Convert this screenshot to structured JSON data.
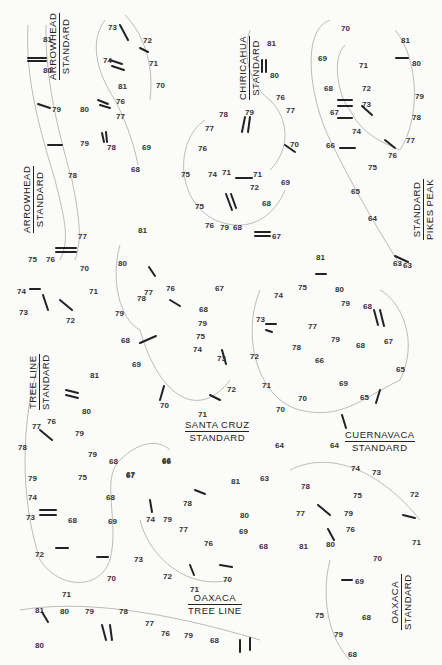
{
  "figure": {
    "panels": [
      {
        "id": "arrowhead-standard-1",
        "line1": "ARROWHEAD",
        "line2": "STANDARD",
        "x": 48,
        "y": 80,
        "vertical": true
      },
      {
        "id": "chiricahua-standard",
        "line1": "CHIRICAHUA",
        "line2": "STANDARD",
        "x": 238,
        "y": 100,
        "vertical": true
      },
      {
        "id": "standard-pikes-peak",
        "line1": "STANDARD",
        "line2": "PIKES PEAK",
        "x": 412,
        "y": 240,
        "vertical": true
      },
      {
        "id": "arrowhead-standard-2",
        "line1": "ARROWHEAD",
        "line2": "STANDARD",
        "x": 22,
        "y": 233,
        "vertical": true
      },
      {
        "id": "tree-line-standard",
        "line1": "TREE LINE",
        "line2": "STANDARD",
        "x": 28,
        "y": 410,
        "vertical": true
      },
      {
        "id": "santa-cruz-standard",
        "line1": "SANTA CRUZ",
        "line2": "STANDARD",
        "x": 185,
        "y": 420,
        "vertical": false
      },
      {
        "id": "cuernavaca-standard",
        "line1": "CUERNAVACA",
        "line2": "STANDARD",
        "x": 345,
        "y": 430,
        "vertical": false
      },
      {
        "id": "oaxaca-tree-line",
        "line1": "OAXACA",
        "line2": "TREE LINE",
        "x": 188,
        "y": 593,
        "vertical": false
      },
      {
        "id": "oaxaca-standard",
        "line1": "OAXACA",
        "line2": "STANDARD",
        "x": 390,
        "y": 630,
        "vertical": true
      }
    ],
    "band_labels": [
      {
        "t": "81",
        "x": 43,
        "y": 36
      },
      {
        "t": "80",
        "x": 43,
        "y": 67
      },
      {
        "t": "79",
        "x": 52,
        "y": 106
      },
      {
        "t": "78",
        "x": 68,
        "y": 172
      },
      {
        "t": "77",
        "x": 78,
        "y": 233
      },
      {
        "t": "73",
        "x": 108,
        "y": 24
      },
      {
        "t": "72",
        "x": 143,
        "y": 37
      },
      {
        "t": "74",
        "x": 103,
        "y": 57
      },
      {
        "t": "71",
        "x": 149,
        "y": 60
      },
      {
        "t": "70",
        "x": 156,
        "y": 82
      },
      {
        "t": "81",
        "x": 118,
        "y": 83
      },
      {
        "t": "80",
        "x": 80,
        "y": 106
      },
      {
        "t": "76",
        "x": 116,
        "y": 98
      },
      {
        "t": "77",
        "x": 116,
        "y": 113
      },
      {
        "t": "79",
        "x": 80,
        "y": 140
      },
      {
        "t": "78",
        "x": 107,
        "y": 144
      },
      {
        "t": "69",
        "x": 142,
        "y": 144
      },
      {
        "t": "68",
        "x": 131,
        "y": 166
      },
      {
        "t": "81",
        "x": 267,
        "y": 40
      },
      {
        "t": "80",
        "x": 270,
        "y": 72
      },
      {
        "t": "76",
        "x": 276,
        "y": 94
      },
      {
        "t": "77",
        "x": 286,
        "y": 107
      },
      {
        "t": "78",
        "x": 219,
        "y": 111
      },
      {
        "t": "79",
        "x": 245,
        "y": 109
      },
      {
        "t": "70",
        "x": 290,
        "y": 141
      },
      {
        "t": "77",
        "x": 205,
        "y": 125
      },
      {
        "t": "76",
        "x": 198,
        "y": 145
      },
      {
        "t": "75",
        "x": 181,
        "y": 171
      },
      {
        "t": "74",
        "x": 208,
        "y": 171
      },
      {
        "t": "71",
        "x": 222,
        "y": 169
      },
      {
        "t": "71",
        "x": 253,
        "y": 171
      },
      {
        "t": "72",
        "x": 250,
        "y": 184
      },
      {
        "t": "69",
        "x": 281,
        "y": 179
      },
      {
        "t": "75",
        "x": 195,
        "y": 203
      },
      {
        "t": "68",
        "x": 262,
        "y": 200
      },
      {
        "t": "76",
        "x": 205,
        "y": 222
      },
      {
        "t": "79",
        "x": 220,
        "y": 224
      },
      {
        "t": "68",
        "x": 233,
        "y": 224
      },
      {
        "t": "67",
        "x": 272,
        "y": 233
      },
      {
        "t": "70",
        "x": 341,
        "y": 25
      },
      {
        "t": "69",
        "x": 318,
        "y": 55
      },
      {
        "t": "71",
        "x": 359,
        "y": 62
      },
      {
        "t": "68",
        "x": 324,
        "y": 85
      },
      {
        "t": "72",
        "x": 362,
        "y": 85
      },
      {
        "t": "67",
        "x": 330,
        "y": 109
      },
      {
        "t": "73",
        "x": 362,
        "y": 101
      },
      {
        "t": "74",
        "x": 352,
        "y": 128
      },
      {
        "t": "66",
        "x": 326,
        "y": 142
      },
      {
        "t": "75",
        "x": 368,
        "y": 164
      },
      {
        "t": "81",
        "x": 401,
        "y": 37
      },
      {
        "t": "80",
        "x": 412,
        "y": 60
      },
      {
        "t": "79",
        "x": 415,
        "y": 93
      },
      {
        "t": "78",
        "x": 412,
        "y": 114
      },
      {
        "t": "77",
        "x": 406,
        "y": 137
      },
      {
        "t": "76",
        "x": 388,
        "y": 152
      },
      {
        "t": "65",
        "x": 351,
        "y": 188
      },
      {
        "t": "64",
        "x": 368,
        "y": 215
      },
      {
        "t": "63",
        "x": 393,
        "y": 260
      },
      {
        "t": "76",
        "x": 46,
        "y": 256
      },
      {
        "t": "75",
        "x": 28,
        "y": 256
      },
      {
        "t": "70",
        "x": 80,
        "y": 265
      },
      {
        "t": "74",
        "x": 17,
        "y": 288
      },
      {
        "t": "71",
        "x": 89,
        "y": 288
      },
      {
        "t": "73",
        "x": 19,
        "y": 309
      },
      {
        "t": "72",
        "x": 66,
        "y": 317
      },
      {
        "t": "81",
        "x": 138,
        "y": 227
      },
      {
        "t": "80",
        "x": 118,
        "y": 260
      },
      {
        "t": "77",
        "x": 144,
        "y": 289
      },
      {
        "t": "76",
        "x": 166,
        "y": 285
      },
      {
        "t": "78",
        "x": 137,
        "y": 295
      },
      {
        "t": "67",
        "x": 215,
        "y": 285
      },
      {
        "t": "79",
        "x": 115,
        "y": 310
      },
      {
        "t": "68",
        "x": 199,
        "y": 306
      },
      {
        "t": "79",
        "x": 198,
        "y": 320
      },
      {
        "t": "68",
        "x": 121,
        "y": 337
      },
      {
        "t": "75",
        "x": 196,
        "y": 333
      },
      {
        "t": "74",
        "x": 193,
        "y": 346
      },
      {
        "t": "69",
        "x": 132,
        "y": 361
      },
      {
        "t": "73",
        "x": 217,
        "y": 355
      },
      {
        "t": "72",
        "x": 227,
        "y": 386
      },
      {
        "t": "70",
        "x": 160,
        "y": 402
      },
      {
        "t": "71",
        "x": 198,
        "y": 411
      },
      {
        "t": "81",
        "x": 316,
        "y": 254
      },
      {
        "t": "75",
        "x": 298,
        "y": 284
      },
      {
        "t": "80",
        "x": 335,
        "y": 286
      },
      {
        "t": "74",
        "x": 274,
        "y": 292
      },
      {
        "t": "79",
        "x": 341,
        "y": 300
      },
      {
        "t": "68",
        "x": 363,
        "y": 303
      },
      {
        "t": "73",
        "x": 256,
        "y": 316
      },
      {
        "t": "77",
        "x": 308,
        "y": 323
      },
      {
        "t": "79",
        "x": 331,
        "y": 336
      },
      {
        "t": "78",
        "x": 292,
        "y": 344
      },
      {
        "t": "68",
        "x": 356,
        "y": 342
      },
      {
        "t": "67",
        "x": 384,
        "y": 338
      },
      {
        "t": "72",
        "x": 250,
        "y": 353
      },
      {
        "t": "66",
        "x": 315,
        "y": 357
      },
      {
        "t": "65",
        "x": 396,
        "y": 366
      },
      {
        "t": "71",
        "x": 262,
        "y": 382
      },
      {
        "t": "69",
        "x": 339,
        "y": 380
      },
      {
        "t": "70",
        "x": 298,
        "y": 395
      },
      {
        "t": "65",
        "x": 360,
        "y": 394
      },
      {
        "t": "70",
        "x": 276,
        "y": 406
      },
      {
        "t": "64",
        "x": 275,
        "y": 442
      },
      {
        "t": "64",
        "x": 330,
        "y": 442
      },
      {
        "t": "63",
        "x": 403,
        "y": 262
      },
      {
        "t": "81",
        "x": 90,
        "y": 372
      },
      {
        "t": "80",
        "x": 82,
        "y": 408
      },
      {
        "t": "76",
        "x": 47,
        "y": 418
      },
      {
        "t": "77",
        "x": 32,
        "y": 423
      },
      {
        "t": "79",
        "x": 75,
        "y": 430
      },
      {
        "t": "78",
        "x": 18,
        "y": 444
      },
      {
        "t": "79",
        "x": 88,
        "y": 451
      },
      {
        "t": "68",
        "x": 109,
        "y": 458
      },
      {
        "t": "67",
        "x": 126,
        "y": 471
      },
      {
        "t": "66",
        "x": 162,
        "y": 457
      },
      {
        "t": "79",
        "x": 28,
        "y": 475
      },
      {
        "t": "75",
        "x": 78,
        "y": 474
      },
      {
        "t": "74",
        "x": 28,
        "y": 494
      },
      {
        "t": "68",
        "x": 106,
        "y": 494
      },
      {
        "t": "73",
        "x": 26,
        "y": 514
      },
      {
        "t": "68",
        "x": 68,
        "y": 517
      },
      {
        "t": "69",
        "x": 108,
        "y": 518
      },
      {
        "t": "72",
        "x": 35,
        "y": 551
      },
      {
        "t": "70",
        "x": 107,
        "y": 575
      },
      {
        "t": "66",
        "x": 162,
        "y": 458
      },
      {
        "t": "67",
        "x": 126,
        "y": 472
      },
      {
        "t": "81",
        "x": 231,
        "y": 478
      },
      {
        "t": "63",
        "x": 260,
        "y": 475
      },
      {
        "t": "78",
        "x": 183,
        "y": 500
      },
      {
        "t": "74",
        "x": 146,
        "y": 516
      },
      {
        "t": "79",
        "x": 163,
        "y": 516
      },
      {
        "t": "80",
        "x": 240,
        "y": 512
      },
      {
        "t": "77",
        "x": 179,
        "y": 526
      },
      {
        "t": "69",
        "x": 239,
        "y": 528
      },
      {
        "t": "76",
        "x": 204,
        "y": 540
      },
      {
        "t": "68",
        "x": 259,
        "y": 543
      },
      {
        "t": "73",
        "x": 134,
        "y": 556
      },
      {
        "t": "72",
        "x": 163,
        "y": 573
      },
      {
        "t": "70",
        "x": 223,
        "y": 576
      },
      {
        "t": "71",
        "x": 190,
        "y": 586
      },
      {
        "t": "74",
        "x": 351,
        "y": 465
      },
      {
        "t": "73",
        "x": 372,
        "y": 469
      },
      {
        "t": "78",
        "x": 301,
        "y": 483
      },
      {
        "t": "75",
        "x": 353,
        "y": 492
      },
      {
        "t": "72",
        "x": 410,
        "y": 491
      },
      {
        "t": "77",
        "x": 296,
        "y": 510
      },
      {
        "t": "79",
        "x": 344,
        "y": 510
      },
      {
        "t": "76",
        "x": 346,
        "y": 526
      },
      {
        "t": "81",
        "x": 299,
        "y": 543
      },
      {
        "t": "80",
        "x": 326,
        "y": 541
      },
      {
        "t": "71",
        "x": 412,
        "y": 539
      },
      {
        "t": "70",
        "x": 373,
        "y": 555
      },
      {
        "t": "69",
        "x": 355,
        "y": 578
      },
      {
        "t": "68",
        "x": 362,
        "y": 614
      },
      {
        "t": "75",
        "x": 315,
        "y": 612
      },
      {
        "t": "79",
        "x": 334,
        "y": 631
      },
      {
        "t": "68",
        "x": 348,
        "y": 651
      },
      {
        "t": "71",
        "x": 62,
        "y": 591
      },
      {
        "t": "81",
        "x": 35,
        "y": 607
      },
      {
        "t": "80",
        "x": 60,
        "y": 608
      },
      {
        "t": "79",
        "x": 85,
        "y": 608
      },
      {
        "t": "78",
        "x": 119,
        "y": 608
      },
      {
        "t": "77",
        "x": 145,
        "y": 620
      },
      {
        "t": "76",
        "x": 161,
        "y": 630
      },
      {
        "t": "79",
        "x": 184,
        "y": 632
      },
      {
        "t": "68",
        "x": 210,
        "y": 637
      },
      {
        "t": "80",
        "x": 35,
        "y": 642
      }
    ]
  }
}
